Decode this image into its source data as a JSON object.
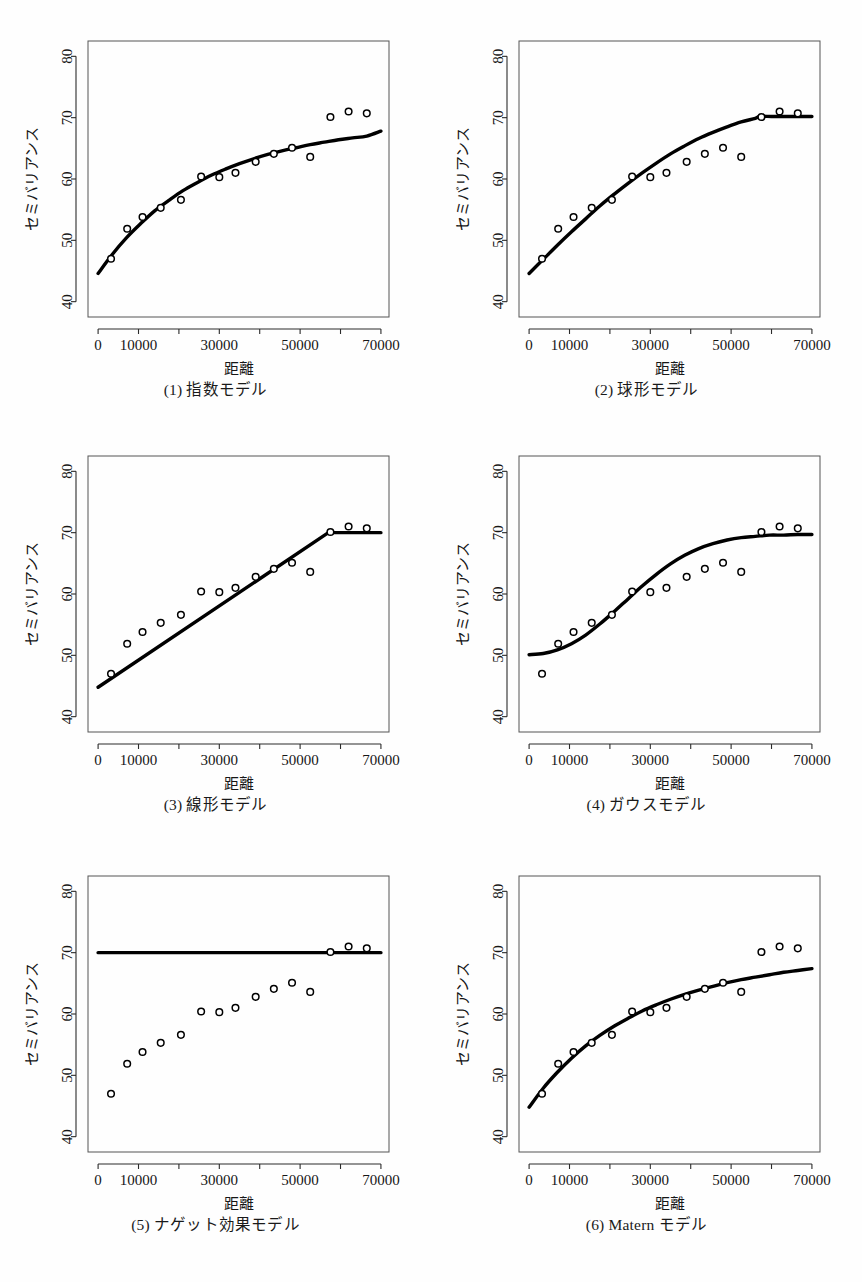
{
  "figure": {
    "panel_width": 431,
    "panel_height": 427,
    "axis": {
      "xlabel": "距離",
      "ylabel": "セミバリアンス",
      "xticks_major": [
        0,
        10000,
        30000,
        50000,
        70000
      ],
      "xticks_minor": [
        20000,
        40000,
        60000
      ],
      "xticklabels": [
        "0",
        "10000",
        "30000",
        "50000",
        "70000"
      ],
      "yticks": [
        40,
        50,
        60,
        70,
        80
      ],
      "yticklabels": [
        "40",
        "50",
        "60",
        "70",
        "80"
      ],
      "xlim": [
        -2500,
        72000
      ],
      "ylim": [
        37.5,
        82.5
      ],
      "grid": false
    }
  },
  "chart_data": [
    {
      "type": "scatter",
      "panel": 1,
      "title": "(1) 指数モデル",
      "xlabel": "距離",
      "ylabel": "セミバリアンス",
      "xlim": [
        -2500,
        72000
      ],
      "ylim": [
        37.5,
        82.5
      ],
      "grid": false,
      "legend": "none",
      "x": [
        3200,
        7200,
        11000,
        15500,
        20500,
        25500,
        30000,
        34000,
        39000,
        43500,
        48000,
        52500,
        57500,
        62000,
        66500
      ],
      "y": [
        47.0,
        51.9,
        53.8,
        55.3,
        56.6,
        60.4,
        60.3,
        61.0,
        62.8,
        64.1,
        65.1,
        63.6,
        70.1,
        71.0,
        70.7
      ],
      "model": {
        "name": "exponential",
        "nugget": 44.6,
        "sill": 68.5,
        "range": 26000,
        "x_start": 0,
        "x_end": 70000,
        "curve_x": [
          0,
          3500,
          7000,
          10500,
          14000,
          17500,
          21000,
          24500,
          28000,
          31500,
          35000,
          38500,
          42000,
          45500,
          49000,
          52500,
          56000,
          59500,
          63000,
          66500,
          70000
        ],
        "curve_y": [
          44.6,
          47.7,
          50.4,
          52.7,
          54.8,
          56.5,
          58.1,
          59.4,
          60.6,
          61.6,
          62.5,
          63.3,
          64.0,
          64.6,
          65.1,
          65.6,
          66.0,
          66.4,
          66.7,
          67.0,
          67.8
        ]
      }
    },
    {
      "type": "scatter",
      "panel": 2,
      "title": "(2) 球形モデル",
      "xlabel": "距離",
      "ylabel": "セミバリアンス",
      "xlim": [
        -2500,
        72000
      ],
      "ylim": [
        37.5,
        82.5
      ],
      "grid": false,
      "legend": "none",
      "x": [
        3200,
        7200,
        11000,
        15500,
        20500,
        25500,
        30000,
        34000,
        39000,
        43500,
        48000,
        52500,
        57500,
        62000,
        66500
      ],
      "y": [
        47.0,
        51.9,
        53.8,
        55.3,
        56.6,
        60.4,
        60.3,
        61.0,
        62.8,
        64.1,
        65.1,
        63.6,
        70.1,
        71.0,
        70.7
      ],
      "model": {
        "name": "spherical",
        "nugget": 44.6,
        "sill": 70.2,
        "range": 57000,
        "x_start": 0,
        "x_end": 70000,
        "curve_x": [
          0,
          3500,
          7000,
          10500,
          14000,
          17500,
          21000,
          24500,
          28000,
          31500,
          35000,
          38500,
          42000,
          45500,
          49000,
          52500,
          56000,
          57000,
          60000,
          63500,
          67000,
          70000
        ],
        "curve_y": [
          44.6,
          46.9,
          49.2,
          51.4,
          53.5,
          55.6,
          57.5,
          59.3,
          61.0,
          62.6,
          64.1,
          65.4,
          66.6,
          67.6,
          68.5,
          69.3,
          69.9,
          70.2,
          70.2,
          70.2,
          70.2,
          70.2
        ]
      }
    },
    {
      "type": "scatter",
      "panel": 3,
      "title": "(3) 線形モデル",
      "xlabel": "距離",
      "ylabel": "セミバリアンス",
      "xlim": [
        -2500,
        72000
      ],
      "ylim": [
        37.5,
        82.5
      ],
      "grid": false,
      "legend": "none",
      "x": [
        3200,
        7200,
        11000,
        15500,
        20500,
        25500,
        30000,
        34000,
        39000,
        43500,
        48000,
        52500,
        57500,
        62000,
        66500
      ],
      "y": [
        47.0,
        51.9,
        53.8,
        55.3,
        56.6,
        60.4,
        60.3,
        61.0,
        62.8,
        64.1,
        65.1,
        63.6,
        70.1,
        71.0,
        70.7
      ],
      "model": {
        "name": "linear",
        "nugget": 44.8,
        "sill": 70.0,
        "range": 57000,
        "x_start": 0,
        "x_end": 70000,
        "curve_x": [
          0,
          57000,
          70000
        ],
        "curve_y": [
          44.8,
          70.0,
          70.0
        ]
      }
    },
    {
      "type": "scatter",
      "panel": 4,
      "title": "(4) ガウスモデル",
      "xlabel": "距離",
      "ylabel": "セミバリアンス",
      "xlim": [
        -2500,
        72000
      ],
      "ylim": [
        37.5,
        82.5
      ],
      "grid": false,
      "legend": "none",
      "x": [
        3200,
        7200,
        11000,
        15500,
        20500,
        25500,
        30000,
        34000,
        39000,
        43500,
        48000,
        52500,
        57500,
        62000,
        66500
      ],
      "y": [
        47.0,
        51.9,
        53.8,
        55.3,
        56.6,
        60.4,
        60.3,
        61.0,
        62.8,
        64.1,
        65.1,
        63.6,
        70.1,
        71.0,
        70.7
      ],
      "model": {
        "name": "gaussian",
        "nugget": 50.1,
        "sill": 69.7,
        "range": 33000,
        "x_start": 0,
        "x_end": 70000,
        "curve_x": [
          0,
          3500,
          7000,
          10500,
          14000,
          17500,
          21000,
          24500,
          28000,
          31500,
          35000,
          38500,
          42000,
          45500,
          49000,
          52500,
          56000,
          59500,
          63000,
          66500,
          70000
        ],
        "curve_y": [
          50.1,
          50.3,
          50.9,
          51.9,
          53.3,
          55.1,
          57.1,
          59.2,
          61.3,
          63.2,
          64.9,
          66.3,
          67.4,
          68.2,
          68.8,
          69.2,
          69.4,
          69.6,
          69.6,
          69.7,
          69.7
        ]
      }
    },
    {
      "type": "scatter",
      "panel": 5,
      "title": "(5) ナゲット効果モデル",
      "xlabel": "距離",
      "ylabel": "セミバリアンス",
      "xlim": [
        -2500,
        72000
      ],
      "ylim": [
        37.5,
        82.5
      ],
      "grid": false,
      "legend": "none",
      "x": [
        3200,
        7200,
        11000,
        15500,
        20500,
        25500,
        30000,
        34000,
        39000,
        43500,
        48000,
        52500,
        57500,
        62000,
        66500
      ],
      "y": [
        47.0,
        51.9,
        53.8,
        55.3,
        56.6,
        60.4,
        60.3,
        61.0,
        62.8,
        64.1,
        65.1,
        63.6,
        70.1,
        71.0,
        70.7
      ],
      "model": {
        "name": "nugget",
        "nugget": 70.0,
        "sill": 70.0,
        "range": 0,
        "x_start": 0,
        "x_end": 70000,
        "curve_x": [
          0,
          70000
        ],
        "curve_y": [
          70.0,
          70.0
        ]
      }
    },
    {
      "type": "scatter",
      "panel": 6,
      "title": "(6) Matern モデル",
      "xlabel": "距離",
      "ylabel": "セミバリアンス",
      "xlim": [
        -2500,
        72000
      ],
      "ylim": [
        37.5,
        82.5
      ],
      "grid": false,
      "legend": "none",
      "x": [
        3200,
        7200,
        11000,
        15500,
        20500,
        25500,
        30000,
        34000,
        39000,
        43500,
        48000,
        52500,
        57500,
        62000,
        66500
      ],
      "y": [
        47.0,
        51.9,
        53.8,
        55.3,
        56.6,
        60.4,
        60.3,
        61.0,
        62.8,
        64.1,
        65.1,
        63.6,
        70.1,
        71.0,
        70.7
      ],
      "model": {
        "name": "matern",
        "nugget": 44.8,
        "sill": 68.2,
        "range": 24000,
        "x_start": 0,
        "x_end": 70000,
        "curve_x": [
          0,
          3500,
          7000,
          10500,
          14000,
          17500,
          21000,
          24500,
          28000,
          31500,
          35000,
          38500,
          42000,
          45500,
          49000,
          52500,
          56000,
          59500,
          63000,
          66500,
          70000
        ],
        "curve_y": [
          44.8,
          47.9,
          50.5,
          52.8,
          54.8,
          56.5,
          58.0,
          59.3,
          60.5,
          61.5,
          62.4,
          63.2,
          63.9,
          64.5,
          65.1,
          65.6,
          66.0,
          66.4,
          66.8,
          67.1,
          67.4
        ]
      }
    }
  ],
  "captions": {
    "p1": "(1) 指数モデル",
    "p2": "(2) 球形モデル",
    "p3": "(3) 線形モデル",
    "p4": "(4) ガウスモデル",
    "p5": "(5) ナゲット効果モデル",
    "p6": "(6) Matern モデル"
  }
}
